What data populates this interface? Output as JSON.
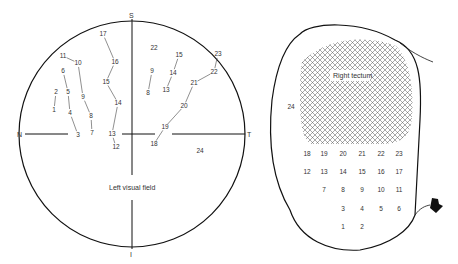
{
  "visual_field": {
    "caption": "Left visual field",
    "axis_labels": {
      "top": "S",
      "bottom": "I",
      "left": "N",
      "right": "T"
    },
    "points": [
      {
        "label": "1",
        "x": 54,
        "y": 110
      },
      {
        "label": "2",
        "x": 56,
        "y": 92
      },
      {
        "label": "3",
        "x": 78,
        "y": 135
      },
      {
        "label": "4",
        "x": 70,
        "y": 113
      },
      {
        "label": "5",
        "x": 68,
        "y": 92
      },
      {
        "label": "6",
        "x": 63,
        "y": 71
      },
      {
        "label": "7",
        "x": 92,
        "y": 133
      },
      {
        "label": "8",
        "x": 91,
        "y": 116
      },
      {
        "label": "9",
        "x": 83,
        "y": 97
      },
      {
        "label": "10",
        "x": 78,
        "y": 63
      },
      {
        "label": "11",
        "x": 63,
        "y": 56
      },
      {
        "label": "12",
        "x": 116,
        "y": 147
      },
      {
        "label": "13",
        "x": 112,
        "y": 134
      },
      {
        "label": "14",
        "x": 118,
        "y": 103
      },
      {
        "label": "15",
        "x": 106,
        "y": 82
      },
      {
        "label": "16",
        "x": 115,
        "y": 62
      },
      {
        "label": "17",
        "x": 103,
        "y": 34
      },
      {
        "label": "8",
        "x": 148,
        "y": 93
      },
      {
        "label": "9",
        "x": 152,
        "y": 71
      },
      {
        "label": "13",
        "x": 166,
        "y": 90
      },
      {
        "label": "14",
        "x": 173,
        "y": 73
      },
      {
        "label": "15",
        "x": 179,
        "y": 55
      },
      {
        "label": "18",
        "x": 154,
        "y": 144
      },
      {
        "label": "19",
        "x": 165,
        "y": 127
      },
      {
        "label": "20",
        "x": 184,
        "y": 106
      },
      {
        "label": "21",
        "x": 194,
        "y": 83
      },
      {
        "label": "22",
        "x": 214,
        "y": 72
      },
      {
        "label": "23",
        "x": 218,
        "y": 54
      },
      {
        "label": "22",
        "x": 154,
        "y": 48
      },
      {
        "label": "24",
        "x": 200,
        "y": 151
      }
    ],
    "connections": [
      [
        0,
        1
      ],
      [
        2,
        3
      ],
      [
        3,
        4
      ],
      [
        4,
        5
      ],
      [
        6,
        7
      ],
      [
        7,
        8
      ],
      [
        8,
        9
      ],
      [
        9,
        10
      ],
      [
        11,
        12
      ],
      [
        12,
        13
      ],
      [
        13,
        14
      ],
      [
        14,
        15
      ],
      [
        15,
        16
      ],
      [
        17,
        18
      ],
      [
        19,
        20
      ],
      [
        20,
        21
      ],
      [
        22,
        23
      ],
      [
        23,
        24
      ],
      [
        24,
        25
      ],
      [
        25,
        26
      ],
      [
        26,
        27
      ]
    ]
  },
  "tectum": {
    "caption": "Right tectum",
    "outside_label": "24",
    "grid_rows": [
      [
        "18",
        "19",
        "20",
        "21",
        "22",
        "23"
      ],
      [
        "12",
        "13",
        "14",
        "15",
        "16",
        "17"
      ],
      [
        "",
        "7",
        "8",
        "9",
        "10",
        "11"
      ],
      [
        "",
        "",
        "3",
        "4",
        "5",
        "6"
      ],
      [
        "",
        "",
        "1",
        "2",
        "",
        ""
      ]
    ],
    "arrow_icon": "black-arrow-pointer"
  }
}
